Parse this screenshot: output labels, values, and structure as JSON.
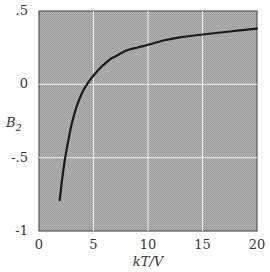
{
  "chart_data": {
    "type": "line",
    "title": "",
    "xlabel": "kT/V",
    "ylabel": "B_2",
    "xlim": [
      0,
      20
    ],
    "ylim": [
      -1,
      0.5
    ],
    "xticks": [
      0,
      5,
      10,
      15,
      20
    ],
    "xtick_labels": [
      "0",
      "5",
      "10",
      "15",
      "20"
    ],
    "yticks": [
      -1,
      -0.5,
      0,
      0.5
    ],
    "ytick_labels": [
      "-1",
      "-.5",
      "0",
      ".5"
    ],
    "grid": true,
    "legend": null,
    "series": [
      {
        "name": "B2",
        "x": [
          1.9,
          2.1,
          2.4,
          2.7,
          3.0,
          3.5,
          4.0,
          4.4,
          5.0,
          5.6,
          6.5,
          7.0,
          8.0,
          9.0,
          10.0,
          11.5,
          12.9,
          15.0,
          17.5,
          20.0
        ],
        "y": [
          -0.79,
          -0.66,
          -0.5,
          -0.38,
          -0.27,
          -0.14,
          -0.05,
          0.0,
          0.06,
          0.11,
          0.17,
          0.19,
          0.23,
          0.25,
          0.27,
          0.3,
          0.32,
          0.34,
          0.36,
          0.38
        ]
      }
    ]
  },
  "labels": {
    "xlabel": "kT/V",
    "ylabel_main": "B",
    "ylabel_sub": "2"
  },
  "colors": {
    "plot_bg": "#a9a9a9",
    "grid": "#f0f0f0",
    "curve": "#1a1a1a",
    "frame": "#555555"
  }
}
